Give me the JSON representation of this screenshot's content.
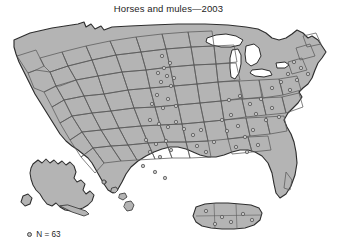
{
  "figure": {
    "title": "Horses and mules—2003",
    "legend": {
      "marker_icon": "open-circle-marker",
      "label": "N = 63"
    },
    "colors": {
      "land_fill": "#b4b4b4",
      "land_stroke": "#3c3c3c",
      "state_stroke": "#5a5a5a",
      "water_fill": "#ffffff",
      "dot_stroke": "#4b4b4b",
      "dot_fill": "#c3c3c3",
      "text": "#1d1d1d",
      "background": "#ffffff"
    },
    "map": {
      "type": "dot-distribution-map",
      "region": "United States including Alaska, Hawaii and Puerto Rico insets",
      "total_dots": 63
    }
  },
  "chart_data": {
    "type": "scatter",
    "title": "Horses and mules—2003",
    "xlabel": "",
    "ylabel": "",
    "legend": [
      "N = 63"
    ],
    "projection": "albers-usa",
    "total_points": 63,
    "insets": [
      "Alaska",
      "Hawaii",
      "Puerto Rico"
    ],
    "points": [
      {
        "x": 162,
        "y": 56
      },
      {
        "x": 170,
        "y": 63
      },
      {
        "x": 164,
        "y": 68
      },
      {
        "x": 158,
        "y": 73
      },
      {
        "x": 167,
        "y": 76
      },
      {
        "x": 174,
        "y": 78
      },
      {
        "x": 161,
        "y": 82
      },
      {
        "x": 171,
        "y": 86
      },
      {
        "x": 157,
        "y": 95
      },
      {
        "x": 168,
        "y": 99
      },
      {
        "x": 152,
        "y": 104
      },
      {
        "x": 163,
        "y": 108
      },
      {
        "x": 176,
        "y": 106
      },
      {
        "x": 150,
        "y": 120
      },
      {
        "x": 159,
        "y": 124
      },
      {
        "x": 168,
        "y": 127
      },
      {
        "x": 176,
        "y": 122
      },
      {
        "x": 184,
        "y": 129
      },
      {
        "x": 146,
        "y": 140
      },
      {
        "x": 156,
        "y": 144
      },
      {
        "x": 166,
        "y": 141
      },
      {
        "x": 150,
        "y": 152
      },
      {
        "x": 160,
        "y": 157
      },
      {
        "x": 171,
        "y": 150
      },
      {
        "x": 143,
        "y": 166
      },
      {
        "x": 155,
        "y": 172
      },
      {
        "x": 165,
        "y": 178
      },
      {
        "x": 193,
        "y": 135
      },
      {
        "x": 201,
        "y": 130
      },
      {
        "x": 197,
        "y": 146
      },
      {
        "x": 206,
        "y": 152
      },
      {
        "x": 214,
        "y": 142
      },
      {
        "x": 222,
        "y": 120
      },
      {
        "x": 231,
        "y": 115
      },
      {
        "x": 227,
        "y": 131
      },
      {
        "x": 238,
        "y": 126
      },
      {
        "x": 245,
        "y": 137
      },
      {
        "x": 253,
        "y": 130
      },
      {
        "x": 236,
        "y": 147
      },
      {
        "x": 247,
        "y": 152
      },
      {
        "x": 258,
        "y": 145
      },
      {
        "x": 229,
        "y": 100
      },
      {
        "x": 240,
        "y": 96
      },
      {
        "x": 250,
        "y": 104
      },
      {
        "x": 261,
        "y": 99
      },
      {
        "x": 256,
        "y": 114
      },
      {
        "x": 266,
        "y": 120
      },
      {
        "x": 272,
        "y": 108
      },
      {
        "x": 279,
        "y": 117
      },
      {
        "x": 272,
        "y": 88
      },
      {
        "x": 281,
        "y": 82
      },
      {
        "x": 290,
        "y": 90
      },
      {
        "x": 288,
        "y": 74
      },
      {
        "x": 297,
        "y": 80
      },
      {
        "x": 301,
        "y": 68
      },
      {
        "x": 294,
        "y": 62
      },
      {
        "x": 308,
        "y": 74
      },
      {
        "x": 206,
        "y": 211
      },
      {
        "x": 222,
        "y": 217
      },
      {
        "x": 231,
        "y": 222
      },
      {
        "x": 243,
        "y": 214
      },
      {
        "x": 252,
        "y": 220
      },
      {
        "x": 215,
        "y": 224
      }
    ]
  }
}
